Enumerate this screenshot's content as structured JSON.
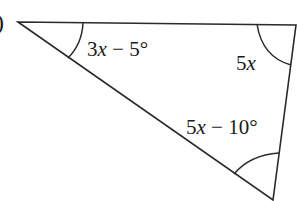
{
  "figure": {
    "part_label": ")",
    "shape": "triangle",
    "line_color": "#2a2a2a",
    "vertices": {
      "top_left": [
        18,
        22
      ],
      "top_right": [
        296,
        25
      ],
      "bottom": [
        273,
        200
      ]
    },
    "angles": [
      {
        "vertex": "top_left",
        "coef": "3",
        "var": "x",
        "rest": " − 5°",
        "full": "3x − 5°"
      },
      {
        "vertex": "top_right",
        "coef": "5",
        "var": "x",
        "rest": "",
        "full": "5x"
      },
      {
        "vertex": "bottom",
        "coef": "5",
        "var": "x",
        "rest": " − 10°",
        "full": "5x − 10°"
      }
    ]
  }
}
